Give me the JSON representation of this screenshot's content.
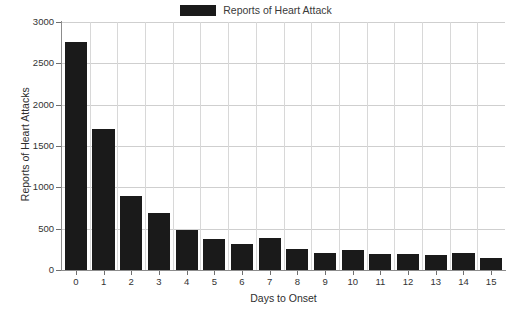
{
  "chart_data": {
    "type": "bar",
    "title": "",
    "legend": [
      "Reports of Heart Attack"
    ],
    "legend_position": "top-center",
    "xlabel": "Days to Onset",
    "ylabel": "Reports of Heart Attacks",
    "categories": [
      "0",
      "1",
      "2",
      "3",
      "4",
      "5",
      "6",
      "7",
      "8",
      "9",
      "10",
      "11",
      "12",
      "13",
      "14",
      "15"
    ],
    "values": [
      2760,
      1710,
      890,
      690,
      490,
      380,
      315,
      390,
      250,
      205,
      240,
      195,
      190,
      180,
      205,
      145
    ],
    "series": [
      {
        "name": "Reports of Heart Attack",
        "color": "#1a1a1a",
        "values": [
          2760,
          1710,
          890,
          690,
          490,
          380,
          315,
          390,
          250,
          205,
          240,
          195,
          190,
          180,
          205,
          145
        ]
      }
    ],
    "ylim": [
      0,
      3000
    ],
    "yticks": [
      0,
      500,
      1000,
      1500,
      2000,
      2500,
      3000
    ],
    "ytick_labels": [
      "0",
      "500",
      "1000",
      "1500",
      "2000",
      "2500",
      "3000"
    ],
    "grid": true,
    "grid_axis": "both",
    "bar_color": "#1a1a1a",
    "grid_color": "#cfcfcf",
    "axis_color": "#8c8c8c"
  }
}
